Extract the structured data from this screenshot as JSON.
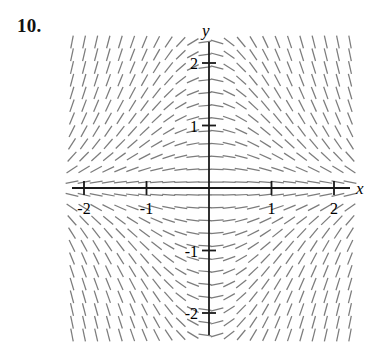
{
  "problem": {
    "number_label": "10."
  },
  "chart_data": {
    "type": "scatter",
    "subtype": "direction-field",
    "title": "",
    "xlabel": "x",
    "ylabel": "y",
    "xlim": [
      -2.2,
      2.28
    ],
    "ylim": [
      -2.35,
      2.33
    ],
    "grid": false,
    "legend": null,
    "axis_labels": {
      "x": "x",
      "y": "y"
    },
    "x_tick_values": [
      -2,
      -1,
      1,
      2
    ],
    "x_tick_labels": [
      "-2",
      "-1",
      "1",
      "2"
    ],
    "y_tick_values": [
      2,
      1,
      -1,
      -2
    ],
    "y_tick_labels": [
      "2",
      "1",
      "-1",
      "-2"
    ],
    "slope_formula": "dy/dx = -x*y",
    "field_bounds_px": {
      "left": 72,
      "right": 350,
      "top": 42,
      "bottom": 335
    },
    "origin_px": {
      "x": 209,
      "y": 188
    },
    "unit_px": 62.5,
    "grid_columns": 24,
    "grid_rows": 24,
    "segment_length_px": 13,
    "colors": {
      "segment": "#7c7c7c",
      "axis": "#1a1a1a",
      "text": "#000000",
      "background": "#ffffff"
    }
  }
}
